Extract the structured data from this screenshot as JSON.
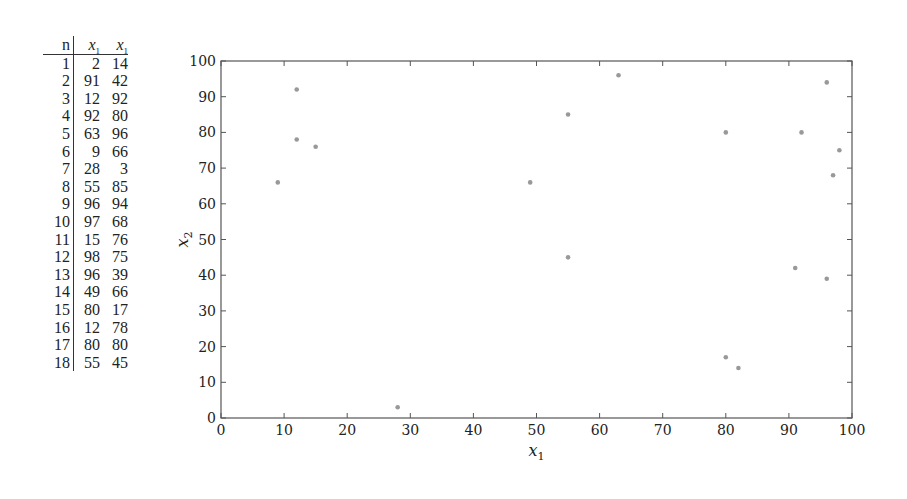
{
  "table": {
    "headers": [
      "n",
      "x1",
      "x1"
    ],
    "rows": [
      [
        "1",
        "2",
        "14"
      ],
      [
        "2",
        "91",
        "42"
      ],
      [
        "3",
        "12",
        "92"
      ],
      [
        "4",
        "92",
        "80"
      ],
      [
        "5",
        "63",
        "96"
      ],
      [
        "6",
        "9",
        "66"
      ],
      [
        "7",
        "28",
        "3"
      ],
      [
        "8",
        "55",
        "85"
      ],
      [
        "9",
        "96",
        "94"
      ],
      [
        "10",
        "97",
        "68"
      ],
      [
        "11",
        "15",
        "76"
      ],
      [
        "12",
        "98",
        "75"
      ],
      [
        "13",
        "96",
        "39"
      ],
      [
        "14",
        "49",
        "66"
      ],
      [
        "15",
        "80",
        "17"
      ],
      [
        "16",
        "12",
        "78"
      ],
      [
        "17",
        "80",
        "80"
      ],
      [
        "18",
        "55",
        "45"
      ]
    ]
  },
  "chart_data": {
    "type": "scatter",
    "title": "",
    "xlabel": "x1",
    "ylabel": "x2",
    "xlim": [
      0,
      100
    ],
    "ylim": [
      0,
      100
    ],
    "xticks": [
      0,
      10,
      20,
      30,
      40,
      50,
      60,
      70,
      80,
      90,
      100
    ],
    "yticks": [
      0,
      10,
      20,
      30,
      40,
      50,
      60,
      70,
      80,
      90,
      100
    ],
    "grid": false,
    "legend": null,
    "marker_color": "#999999",
    "points": [
      [
        9,
        66
      ],
      [
        12,
        92
      ],
      [
        12,
        78
      ],
      [
        15,
        76
      ],
      [
        28,
        3
      ],
      [
        49,
        66
      ],
      [
        55,
        85
      ],
      [
        55,
        45
      ],
      [
        63,
        96
      ],
      [
        80,
        80
      ],
      [
        80,
        17
      ],
      [
        82,
        14
      ],
      [
        91,
        42
      ],
      [
        92,
        80
      ],
      [
        96,
        94
      ],
      [
        96,
        39
      ],
      [
        97,
        68
      ],
      [
        98,
        75
      ]
    ]
  }
}
